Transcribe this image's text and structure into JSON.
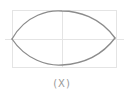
{
  "diagram": {
    "shape": "lens",
    "caption": "(X)",
    "colors": {
      "guide": "#e4e4e4",
      "stroke": "#8c8c8c",
      "caption": "#9a9a9a",
      "background": "#ffffff"
    },
    "bounding_box": {
      "x": 12,
      "y": 10,
      "width": 104,
      "height": 57
    },
    "guides": {
      "horizontal_y": 39,
      "vertical_x": 62
    },
    "lens": {
      "left_tip": [
        12,
        39
      ],
      "right_tip": [
        115,
        38
      ],
      "top_y": 11,
      "bottom_y": 65
    }
  }
}
